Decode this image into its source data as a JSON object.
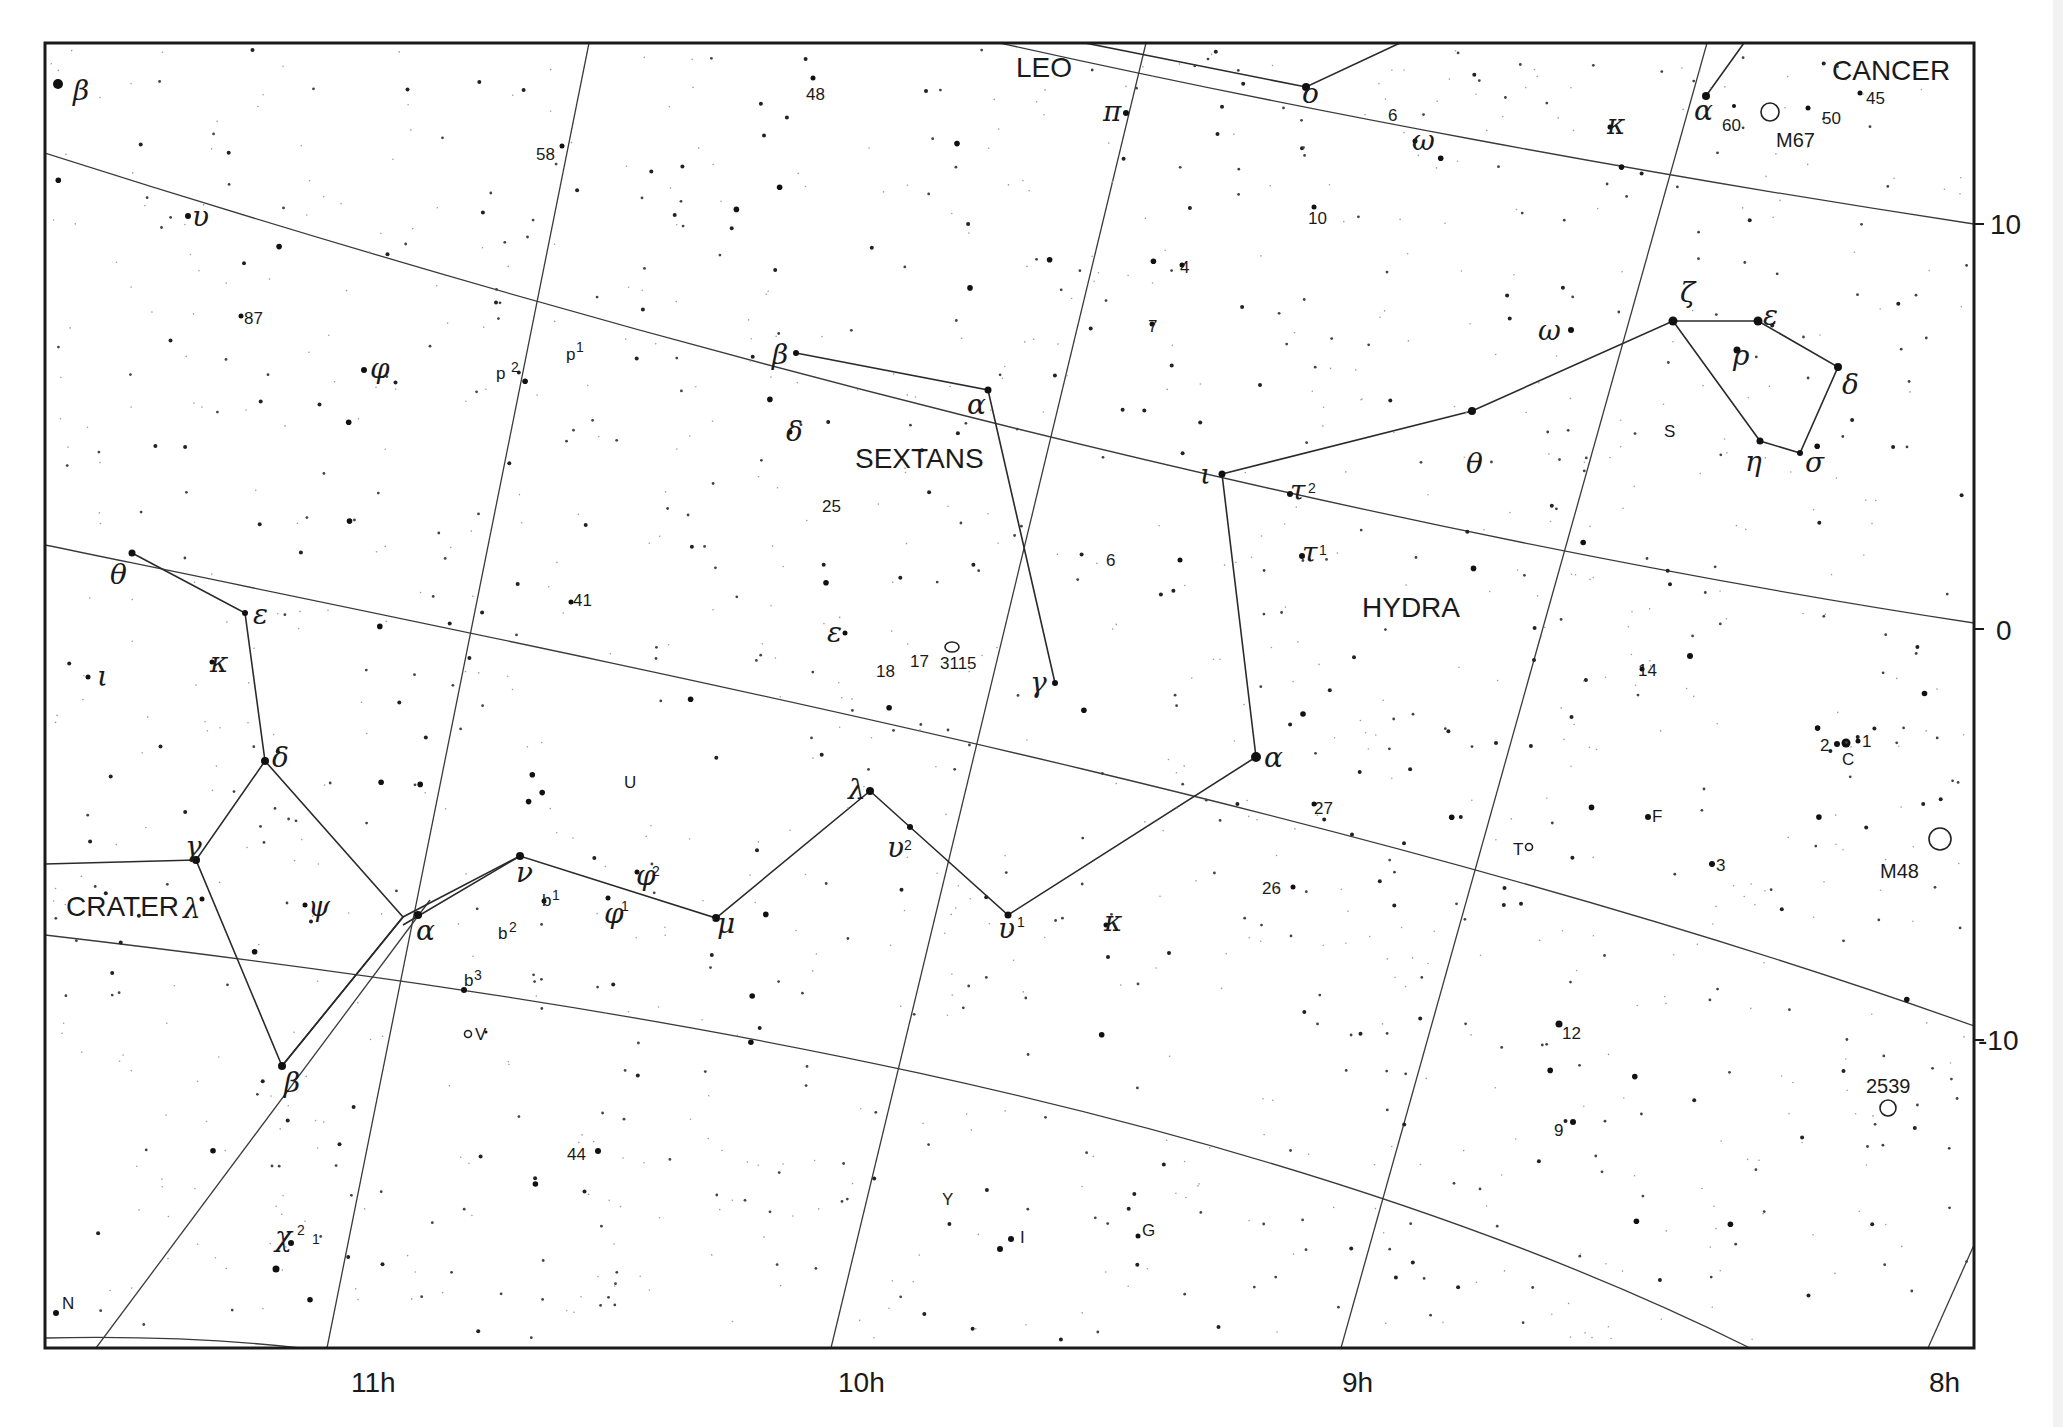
{
  "chart": {
    "frame": {
      "x1": 45,
      "y1": 43,
      "x2": 1974,
      "y2": 1348
    },
    "ra_labels": [
      {
        "text": "11h",
        "x": 351,
        "y": 1392
      },
      {
        "text": "10h",
        "x": 838,
        "y": 1392
      },
      {
        "text": "9h",
        "x": 1342,
        "y": 1392
      },
      {
        "text": "8h",
        "x": 1929,
        "y": 1392
      }
    ],
    "dec_labels": [
      {
        "text": "10",
        "x": 1990,
        "y": 234
      },
      {
        "text": "0",
        "x": 1996,
        "y": 640
      },
      {
        "text": "-10",
        "x": 1978,
        "y": 1050
      }
    ]
  },
  "constellations": [
    {
      "name": "LEO",
      "x": 1016,
      "y": 77
    },
    {
      "name": "CANCER",
      "x": 1832,
      "y": 80
    },
    {
      "name": "SEXTANS",
      "x": 855,
      "y": 468
    },
    {
      "name": "HYDRA",
      "x": 1362,
      "y": 617
    },
    {
      "name": "CRATER",
      "x": 66,
      "y": 916
    }
  ],
  "greek_labels": [
    {
      "text": "β",
      "x": 73,
      "y": 100
    },
    {
      "text": "υ",
      "x": 192,
      "y": 226
    },
    {
      "text": "φ",
      "x": 370,
      "y": 378
    },
    {
      "text": "θ",
      "x": 110,
      "y": 584
    },
    {
      "text": "ε",
      "x": 253,
      "y": 624
    },
    {
      "text": "κ",
      "x": 210,
      "y": 672
    },
    {
      "text": "ι",
      "x": 97,
      "y": 686
    },
    {
      "text": "δ",
      "x": 272,
      "y": 767
    },
    {
      "text": "γ",
      "x": 185,
      "y": 856
    },
    {
      "text": "λ",
      "x": 183,
      "y": 918
    },
    {
      "text": "ψ",
      "x": 308,
      "y": 916
    },
    {
      "text": "α",
      "x": 416,
      "y": 940
    },
    {
      "text": "β",
      "x": 284,
      "y": 1092
    },
    {
      "text": "χ",
      "x": 275,
      "y": 1246
    },
    {
      "text": "ν",
      "x": 516,
      "y": 882
    },
    {
      "text": "φ",
      "x": 604,
      "y": 923
    },
    {
      "text": "φ",
      "x": 636,
      "y": 885
    },
    {
      "text": "μ",
      "x": 717,
      "y": 933
    },
    {
      "text": "λ",
      "x": 848,
      "y": 799
    },
    {
      "text": "υ",
      "x": 887,
      "y": 857
    },
    {
      "text": "υ",
      "x": 998,
      "y": 938
    },
    {
      "text": "κ",
      "x": 1104,
      "y": 931
    },
    {
      "text": "ε",
      "x": 827,
      "y": 642
    },
    {
      "text": "γ",
      "x": 1030,
      "y": 692
    },
    {
      "text": "β",
      "x": 772,
      "y": 364
    },
    {
      "text": "α",
      "x": 967,
      "y": 414
    },
    {
      "text": "δ",
      "x": 786,
      "y": 441
    },
    {
      "text": "π",
      "x": 1103,
      "y": 121
    },
    {
      "text": "ο",
      "x": 1302,
      "y": 103
    },
    {
      "text": "ω",
      "x": 1412,
      "y": 150
    },
    {
      "text": "κ",
      "x": 1607,
      "y": 134
    },
    {
      "text": "α",
      "x": 1694,
      "y": 120
    },
    {
      "text": "ι",
      "x": 1200,
      "y": 484
    },
    {
      "text": "τ",
      "x": 1290,
      "y": 500
    },
    {
      "text": "τ",
      "x": 1302,
      "y": 562
    },
    {
      "text": "α",
      "x": 1264,
      "y": 767
    },
    {
      "text": "θ",
      "x": 1466,
      "y": 473
    },
    {
      "text": "ω",
      "x": 1538,
      "y": 340
    },
    {
      "text": "ζ",
      "x": 1680,
      "y": 302
    },
    {
      "text": "ε",
      "x": 1763,
      "y": 325
    },
    {
      "text": "ρ",
      "x": 1733,
      "y": 365
    },
    {
      "text": "δ",
      "x": 1842,
      "y": 394
    },
    {
      "text": "η",
      "x": 1745,
      "y": 471
    },
    {
      "text": "σ",
      "x": 1805,
      "y": 472
    }
  ],
  "superscripts": [
    {
      "text": "2",
      "x": 652,
      "y": 876
    },
    {
      "text": "1",
      "x": 621,
      "y": 911
    },
    {
      "text": "2",
      "x": 904,
      "y": 850
    },
    {
      "text": "1",
      "x": 1017,
      "y": 927
    },
    {
      "text": "2",
      "x": 1308,
      "y": 493
    },
    {
      "text": "1",
      "x": 1319,
      "y": 555
    },
    {
      "text": "2",
      "x": 297,
      "y": 1235
    },
    {
      "text": "1",
      "x": 312,
      "y": 1244
    }
  ],
  "number_labels": [
    {
      "text": "58",
      "x": 536,
      "y": 160
    },
    {
      "text": "48",
      "x": 806,
      "y": 100
    },
    {
      "text": "87",
      "x": 244,
      "y": 324
    },
    {
      "text": "p",
      "x": 496,
      "y": 379
    },
    {
      "text": "p",
      "x": 566,
      "y": 360
    },
    {
      "text": "25",
      "x": 822,
      "y": 512
    },
    {
      "text": "41",
      "x": 573,
      "y": 606
    },
    {
      "text": "18",
      "x": 876,
      "y": 677
    },
    {
      "text": "17",
      "x": 910,
      "y": 667
    },
    {
      "text": "3115",
      "x": 940,
      "y": 669
    },
    {
      "text": "6",
      "x": 1106,
      "y": 566
    },
    {
      "text": "4",
      "x": 1180,
      "y": 273
    },
    {
      "text": "7",
      "x": 1148,
      "y": 332
    },
    {
      "text": "10",
      "x": 1308,
      "y": 224
    },
    {
      "text": "6",
      "x": 1388,
      "y": 121
    },
    {
      "text": "60",
      "x": 1722,
      "y": 131
    },
    {
      "text": "50",
      "x": 1822,
      "y": 124
    },
    {
      "text": "45",
      "x": 1866,
      "y": 104
    },
    {
      "text": "U",
      "x": 624,
      "y": 788
    },
    {
      "text": "b",
      "x": 542,
      "y": 906
    },
    {
      "text": "b",
      "x": 498,
      "y": 939
    },
    {
      "text": "b",
      "x": 464,
      "y": 986
    },
    {
      "text": "V",
      "x": 475,
      "y": 1040
    },
    {
      "text": "44",
      "x": 567,
      "y": 1160
    },
    {
      "text": "27",
      "x": 1314,
      "y": 814
    },
    {
      "text": "26",
      "x": 1262,
      "y": 894
    },
    {
      "text": "14",
      "x": 1638,
      "y": 676
    },
    {
      "text": "F",
      "x": 1652,
      "y": 822
    },
    {
      "text": "3",
      "x": 1716,
      "y": 871
    },
    {
      "text": "12",
      "x": 1562,
      "y": 1039
    },
    {
      "text": "9",
      "x": 1554,
      "y": 1136
    },
    {
      "text": "Y",
      "x": 942,
      "y": 1205
    },
    {
      "text": "I",
      "x": 1020,
      "y": 1243
    },
    {
      "text": "G",
      "x": 1142,
      "y": 1236
    },
    {
      "text": "S",
      "x": 1664,
      "y": 437
    },
    {
      "text": "T",
      "x": 1513,
      "y": 855
    },
    {
      "text": "C",
      "x": 1842,
      "y": 765
    },
    {
      "text": "2",
      "x": 1820,
      "y": 751
    },
    {
      "text": "1",
      "x": 1862,
      "y": 747
    },
    {
      "text": "N",
      "x": 62,
      "y": 1309
    }
  ],
  "small_sups": [
    {
      "text": "2",
      "x": 511,
      "y": 372
    },
    {
      "text": "1",
      "x": 576,
      "y": 352
    },
    {
      "text": "1",
      "x": 552,
      "y": 900
    },
    {
      "text": "2",
      "x": 509,
      "y": 932
    },
    {
      "text": "3",
      "x": 474,
      "y": 980
    }
  ],
  "objects": [
    {
      "label": "M67",
      "x": 1776,
      "y": 147,
      "cx": 1770,
      "cy": 112,
      "r": 9
    },
    {
      "label": "M48",
      "x": 1880,
      "y": 878,
      "cx": 1940,
      "cy": 839,
      "r": 11
    },
    {
      "label": "2539",
      "x": 1866,
      "y": 1093,
      "cx": 1886,
      "cy": 1108,
      "r": 8
    },
    {
      "label": "",
      "x": 0,
      "y": 0,
      "cx": 952,
      "cy": 647,
      "r": 7
    }
  ]
}
